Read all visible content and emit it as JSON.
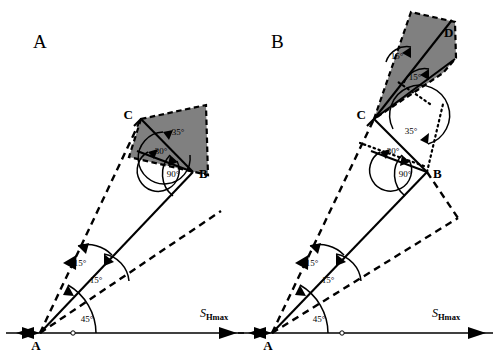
{
  "figure": {
    "background_color": "#ffffff",
    "stroke_color": "#000000",
    "shade_color": "#808080"
  },
  "panels": [
    {
      "id": "panel-a",
      "label": "A",
      "label_pos": {
        "x": 33,
        "y": 48
      },
      "origin": {
        "x": 40,
        "y": 333,
        "label": "A"
      },
      "vertices": [
        {
          "name": "A",
          "label": "A",
          "x": 40,
          "y": 333
        },
        {
          "name": "B",
          "label": "B",
          "x": 193,
          "y": 172
        },
        {
          "name": "C",
          "label": "C",
          "x": 141,
          "y": 119
        }
      ],
      "angles": [
        {
          "label": "45°",
          "x": 87,
          "y": 322
        },
        {
          "label": "15°",
          "x": 94,
          "y": 282
        },
        {
          "label": "15°",
          "x": 79,
          "y": 265
        },
        {
          "label": "90°",
          "x": 173,
          "y": 176
        },
        {
          "label": "30°",
          "x": 160,
          "y": 152
        },
        {
          "label": "35°",
          "x": 177,
          "y": 133
        }
      ],
      "axis": {
        "label_main": "S",
        "label_sub": "Hmax",
        "label_x": 200,
        "label_y": 316,
        "y": 333,
        "x_start": 6,
        "x_end": 244
      }
    },
    {
      "id": "panel-b",
      "label": "B",
      "label_pos": {
        "x": 271,
        "y": 48
      },
      "origin": {
        "x": 272,
        "y": 333,
        "label": "A"
      },
      "vertices": [
        {
          "name": "A",
          "label": "A",
          "x": 272,
          "y": 333
        },
        {
          "name": "B",
          "label": "B",
          "x": 427,
          "y": 172
        },
        {
          "name": "C",
          "label": "C",
          "x": 374,
          "y": 119
        },
        {
          "name": "D",
          "label": "D",
          "x": 447,
          "y": 31
        }
      ],
      "angles": [
        {
          "label": "45°",
          "x": 319,
          "y": 322
        },
        {
          "label": "15°",
          "x": 326,
          "y": 282
        },
        {
          "label": "15°",
          "x": 311,
          "y": 265
        },
        {
          "label": "90°",
          "x": 405,
          "y": 176
        },
        {
          "label": "30°",
          "x": 392,
          "y": 152
        },
        {
          "label": "35°",
          "x": 410,
          "y": 132
        },
        {
          "label": "15°",
          "x": 396,
          "y": 56
        },
        {
          "label": "15°",
          "x": 414,
          "y": 77
        }
      ],
      "axis": {
        "label_main": "S",
        "label_sub": "Hmax",
        "label_x": 432,
        "label_y": 316,
        "y": 333,
        "x_start": 238,
        "x_end": 493
      }
    }
  ]
}
